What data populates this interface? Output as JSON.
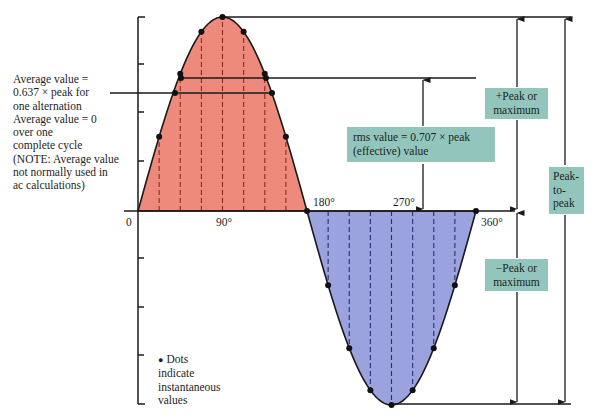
{
  "diagram": {
    "colors": {
      "positive_fill": "#ee8a7c",
      "negative_fill": "#9aa3de",
      "label_box": "#92c6bd",
      "line": "#1a1a1a",
      "dash_positive": "#8b2a23",
      "dash_negative": "#2a2f6e"
    },
    "axis_labels": {
      "origin": "0",
      "deg90": "90°",
      "deg180": "180°",
      "deg270": "270°",
      "deg360": "360°"
    },
    "average_note": {
      "lines": [
        "Average value =",
        "0.637 × peak for",
        "one alternation",
        "Average value = 0",
        "over one",
        "complete cycle",
        "(NOTE: Average value",
        "not normally used in",
        "ac calculations)"
      ]
    },
    "rms_box": {
      "line1": "rms value = 0.707 × peak",
      "line2": "(effective) value"
    },
    "pos_peak_box": {
      "line1": "+Peak or",
      "line2": "maximum"
    },
    "neg_peak_box": {
      "line1": "−Peak or",
      "line2": "maximum"
    },
    "peak_to_peak_box": {
      "line1": "Peak-",
      "line2": "to-",
      "line3": "peak"
    },
    "dots_legend": {
      "bullet": "●",
      "line1": "Dots",
      "line2": "indicate",
      "line3": "instantaneous",
      "line4": "values"
    },
    "values": {
      "average_factor": 0.637,
      "rms_factor": 0.707,
      "sample_step_degrees": 22.5
    }
  }
}
